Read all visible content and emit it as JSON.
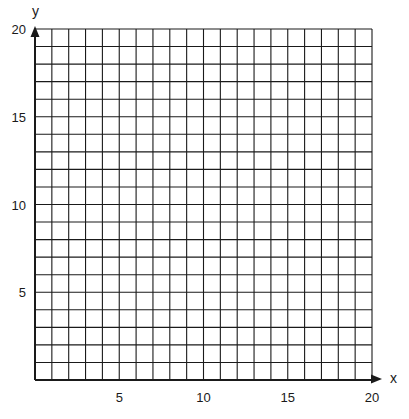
{
  "chart_data": {
    "type": "grid",
    "title": "",
    "xlabel": "x",
    "ylabel": "y",
    "xlim": [
      0,
      20
    ],
    "ylim": [
      0,
      20
    ],
    "grid": true,
    "grid_step": 1,
    "x_ticks": [
      5,
      10,
      15,
      20
    ],
    "y_ticks": [
      5,
      10,
      15,
      20
    ],
    "x_tick_labels": [
      "5",
      "10",
      "15",
      "20"
    ],
    "y_tick_labels": [
      "5",
      "10",
      "15",
      "20"
    ],
    "series": [],
    "legend": null
  },
  "colors": {
    "line": "#1a1a1a",
    "background": "#ffffff"
  }
}
